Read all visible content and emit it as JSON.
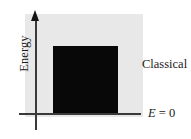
{
  "figure": {
    "axes": {
      "y_axis_label": "Energy",
      "x_axis_label": "",
      "zero_line_label": {
        "symbol": "E",
        "operator": "=",
        "value": "0",
        "full": "E = 0"
      }
    },
    "regions": [
      {
        "name": "classical-region",
        "label": "Classical",
        "color": "#e8e8e8"
      },
      {
        "name": "continuum-block",
        "label": "",
        "color": "#080808"
      }
    ],
    "colors": {
      "background": "#ffffff",
      "backdrop_gray": "#e8e8e8",
      "block_black": "#080808",
      "axis_line": "#3a3a3a",
      "arrow_head": "#151515",
      "text": "#1a1a1a"
    }
  },
  "chart_data": {
    "type": "area",
    "title": "",
    "subtitle": "",
    "xlabel": "",
    "ylabel": "Energy",
    "grid": false,
    "legend": "none",
    "annotations": [
      {
        "text": "Classical",
        "x": 0.99,
        "y": 0.48,
        "align": "left"
      },
      {
        "text": "E = 0",
        "x": 1.06,
        "y": 0.0,
        "align": "left"
      }
    ],
    "axis_notes": {
      "y_axis": "Energy, arrow pointing up, no tick labels",
      "x_axis": "horizontal reference line at E = 0, no tick labels"
    },
    "series": [
      {
        "name": "Classical region (backdrop)",
        "type": "region",
        "color": "#e8e8e8",
        "x_range": [
          -0.1,
          1.0
        ],
        "y_range": [
          0.0,
          1.0
        ]
      },
      {
        "name": "Continuum of allowed energies",
        "type": "region",
        "color": "#080808",
        "x_range": [
          0.16,
          0.78
        ],
        "y_range": [
          0.0,
          0.66
        ],
        "note": "solid black block representing a continuum of allowed classical energies above E = 0"
      }
    ]
  }
}
